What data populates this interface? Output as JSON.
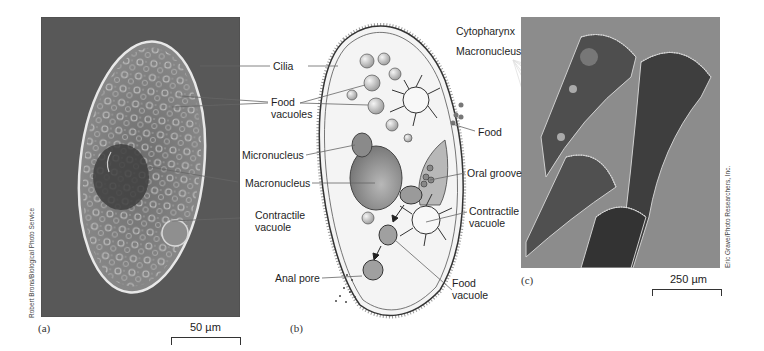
{
  "figure": {
    "panels": [
      {
        "id": "a",
        "letter": "(a)",
        "scale_bar": "50 µm",
        "credit": "Robert Brons/Biological Photo Service",
        "kind": "micrograph-paramecium"
      },
      {
        "id": "b",
        "letter": "(b)",
        "kind": "diagram-paramecium"
      },
      {
        "id": "c",
        "letter": "(c)",
        "scale_bar": "250 µm",
        "credit": "Eric Grave/Photo Researchers, Inc.",
        "kind": "micrograph-stentor"
      }
    ],
    "labels_left": {
      "cilia": "Cilia",
      "food_vacuoles_1": "Food",
      "food_vacuoles_2": "vacuoles",
      "micronucleus": "Micronucleus",
      "macronucleus": "Macronucleus",
      "contractile_vacuole_1": "Contractile",
      "contractile_vacuole_2": "vacuole",
      "anal_pore": "Anal pore"
    },
    "labels_right": {
      "cytopharynx": "Cytopharynx",
      "macronucleus": "Macronucleus",
      "food": "Food",
      "oral_groove": "Oral groove",
      "contractile_vacuole_1": "Contractile",
      "contractile_vacuole_2": "vacuole",
      "food_vacuole_1": "Food",
      "food_vacuole_2": "vacuole"
    },
    "colors": {
      "micrograph_a_bg": "#555555",
      "micrograph_c_bg": "#8a8a8a",
      "diagram_fill": "#f2f2f2",
      "nucleus": "#7a7a7a",
      "leader_line": "#555555"
    }
  }
}
